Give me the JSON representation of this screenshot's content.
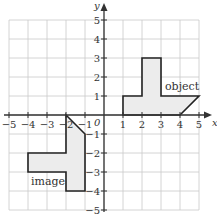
{
  "axes": {
    "x_label": "x",
    "y_label": "y",
    "origin_label": "0",
    "x_range": [
      -5,
      5
    ],
    "y_range": [
      -5,
      5
    ],
    "x_ticks": [
      "−5",
      "−4",
      "−3",
      "−2",
      "−1",
      "1",
      "2",
      "3",
      "4",
      "5"
    ],
    "y_ticks": [
      "5",
      "4",
      "3",
      "2",
      "1",
      "−1",
      "−2",
      "−3",
      "−4",
      "−5"
    ]
  },
  "shapes": {
    "object": {
      "label": "object",
      "vertices": [
        [
          1,
          0
        ],
        [
          1,
          1
        ],
        [
          2,
          1
        ],
        [
          2,
          3
        ],
        [
          3,
          3
        ],
        [
          3,
          1
        ],
        [
          5,
          1
        ],
        [
          4,
          0
        ]
      ]
    },
    "image": {
      "label": "image",
      "vertices": [
        [
          -2,
          0
        ],
        [
          -1,
          -1
        ],
        [
          -1,
          -4
        ],
        [
          -2,
          -4
        ],
        [
          -2,
          -3
        ],
        [
          -4,
          -3
        ],
        [
          -4,
          -2
        ],
        [
          -2,
          -2
        ]
      ]
    }
  },
  "colors": {
    "shape_fill": "#ececec",
    "shape_stroke": "#222222",
    "grid": "#c9c9c9",
    "axis": "#333333"
  }
}
